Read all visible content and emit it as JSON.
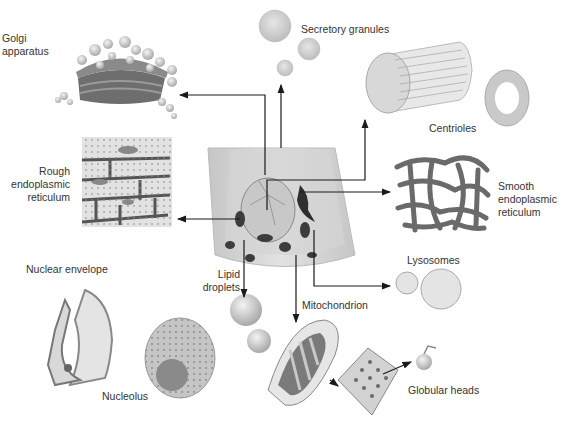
{
  "diagram": {
    "type": "cell organelles illustration",
    "center": "epithelial cell",
    "labels": {
      "golgi": "Golgi\napparatus",
      "secretory": "Secretory granules",
      "centrioles": "Centrioles",
      "rough_er": "Rough\nendoplasmic\nreticulum",
      "smooth_er": "Smooth\nendoplasmic\nreticulum",
      "lysosomes": "Lysosomes",
      "nuclear_envelope": "Nuclear envelope",
      "lipid": "Lipid\ndroplets",
      "mitochondrion": "Mitochondrion",
      "nucleolus": "Nucleolus",
      "globular": "Globular heads"
    },
    "colors": {
      "arrow": "#1a1a1a",
      "organelle_dark": "#5a5a5a",
      "organelle_mid": "#9a9a9a",
      "organelle_light": "#d6d6d6",
      "cell_body": "#cfcfcf"
    }
  }
}
